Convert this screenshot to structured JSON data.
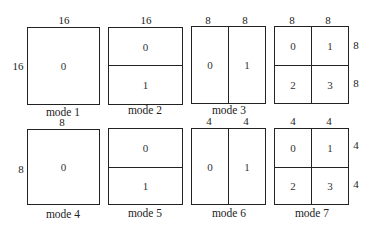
{
  "row1": {
    "mode1": {
      "caption": "mode 1",
      "top": "16",
      "left": "16",
      "cells": [
        "0"
      ]
    },
    "mode2": {
      "caption": "mode 2",
      "top": "16",
      "cells": [
        "0",
        "1"
      ]
    },
    "mode3": {
      "caption": "mode 3",
      "top": [
        "8",
        "8"
      ],
      "cells": [
        "0",
        "1"
      ]
    },
    "mode_quad": {
      "caption": "",
      "top": [
        "8",
        "8"
      ],
      "right": [
        "8",
        "8"
      ],
      "cells": [
        "0",
        "1",
        "2",
        "3"
      ]
    }
  },
  "row2": {
    "mode4": {
      "caption": "mode 4",
      "top": "8",
      "left": "8",
      "cells": [
        "0"
      ]
    },
    "mode5": {
      "caption": "mode 5",
      "cells": [
        "0",
        "1"
      ]
    },
    "mode6": {
      "caption": "mode 6",
      "top": [
        "4",
        "4"
      ],
      "cells": [
        "0",
        "1"
      ]
    },
    "mode7": {
      "caption": "mode 7",
      "top": [
        "4",
        "4"
      ],
      "right": [
        "4",
        "4"
      ],
      "cells": [
        "0",
        "1",
        "2",
        "3"
      ]
    }
  }
}
